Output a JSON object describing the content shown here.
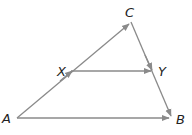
{
  "diagram": {
    "type": "triangle-with-parallel-segment",
    "line_color": "#8a8a8a",
    "label_color": "#222222",
    "points": {
      "A": {
        "label": "A",
        "x": 17,
        "y": 118
      },
      "B": {
        "label": "B",
        "x": 171,
        "y": 118
      },
      "C": {
        "label": "C",
        "x": 131,
        "y": 22
      },
      "X": {
        "label": "X",
        "x": 71,
        "y": 71
      },
      "Y": {
        "label": "Y",
        "x": 153,
        "y": 71
      }
    },
    "segments": [
      {
        "name": "AC",
        "from": "A",
        "to": "C",
        "arrows": [
          "mid-at-X",
          "end-at-C"
        ]
      },
      {
        "name": "CB",
        "from": "C",
        "to": "B",
        "arrows": [
          "at-Y",
          "end-at-B"
        ]
      },
      {
        "name": "XY",
        "from": "X",
        "to": "Y",
        "arrows": [
          "end-at-Y"
        ]
      },
      {
        "name": "AB",
        "from": "A",
        "to": "B",
        "arrows": [
          "end-at-B"
        ]
      }
    ]
  }
}
